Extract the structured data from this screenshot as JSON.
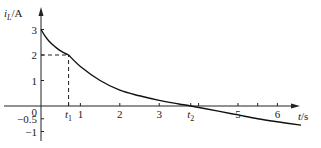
{
  "chart_data": {
    "type": "line",
    "title": "",
    "xlabel": "t/s",
    "ylabel": "i_L/A",
    "ylabel_main": "i",
    "ylabel_sub": "L",
    "ylabel_unit": "/A",
    "xlabel_var": "t",
    "xlabel_unit": "/s",
    "xlim": [
      0,
      6.8
    ],
    "ylim": [
      -1.1,
      3.4
    ],
    "grid": false,
    "legend": null,
    "x_ticks": [
      {
        "value": 0.7,
        "label": "t",
        "sub": "1"
      },
      {
        "value": 1,
        "label": "1"
      },
      {
        "value": 2,
        "label": "2"
      },
      {
        "value": 3,
        "label": "3"
      },
      {
        "value": 3.8,
        "label": "t",
        "sub": "2"
      },
      {
        "value": 4,
        "label": ""
      },
      {
        "value": 5,
        "label": "5"
      },
      {
        "value": 5.5,
        "label": ""
      },
      {
        "value": 6,
        "label": "6"
      }
    ],
    "y_ticks": [
      {
        "value": 3,
        "label": "3"
      },
      {
        "value": 2,
        "label": "2"
      },
      {
        "value": 1,
        "label": "1"
      },
      {
        "value": 0,
        "label": "0"
      },
      {
        "value": -0.5,
        "label": "−0.5"
      },
      {
        "value": -1,
        "label": "−1"
      }
    ],
    "series": [
      {
        "name": "i_L(t)",
        "segments": [
          {
            "range": [
              0,
              0.7
            ],
            "description": "exponential decay from 3 A to 2 A",
            "x": [
              0,
              0.1,
              0.2,
              0.3,
              0.4,
              0.5,
              0.6,
              0.7
            ],
            "y": [
              3.0,
              2.75,
              2.55,
              2.4,
              2.27,
              2.16,
              2.07,
              2.0
            ]
          },
          {
            "range": [
              0.7,
              6.6
            ],
            "description": "exponential decay from 2 A toward negative value, crossing zero at t2",
            "x": [
              0.7,
              1.0,
              1.5,
              2.0,
              2.5,
              3.0,
              3.5,
              3.8,
              4.5,
              5.0,
              5.5,
              6.0,
              6.6
            ],
            "y": [
              2.0,
              1.55,
              1.0,
              0.62,
              0.4,
              0.22,
              0.08,
              0.0,
              -0.2,
              -0.35,
              -0.5,
              -0.62,
              -0.75
            ]
          }
        ]
      }
    ],
    "annotations": [
      {
        "type": "dashed-guide",
        "from": [
          0,
          2
        ],
        "to": [
          0.7,
          2
        ],
        "description": "horizontal dashed line at i=2 to t1"
      },
      {
        "type": "dashed-guide",
        "from": [
          0.7,
          0
        ],
        "to": [
          0.7,
          2
        ],
        "description": "vertical dashed line at t1"
      },
      {
        "type": "point-label",
        "at": [
          0.7,
          0
        ],
        "text": "t1"
      },
      {
        "type": "point-label",
        "at": [
          3.8,
          0
        ],
        "text": "t2",
        "description": "zero crossing"
      }
    ]
  }
}
